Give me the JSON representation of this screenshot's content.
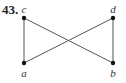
{
  "problem": {
    "number": "43."
  },
  "graph": {
    "nodes": [
      {
        "id": "c",
        "label": "c",
        "x": 24,
        "y": 18,
        "label_x": 24,
        "label_y": 12
      },
      {
        "id": "d",
        "label": "d",
        "x": 113,
        "y": 18,
        "label_x": 113,
        "label_y": 12
      },
      {
        "id": "a",
        "label": "a",
        "x": 24,
        "y": 63,
        "label_x": 24,
        "label_y": 77
      },
      {
        "id": "b",
        "label": "b",
        "x": 113,
        "y": 63,
        "label_x": 113,
        "label_y": 77
      }
    ],
    "edges": [
      {
        "from": "c",
        "to": "a"
      },
      {
        "from": "d",
        "to": "b"
      },
      {
        "from": "c",
        "to": "b"
      },
      {
        "from": "a",
        "to": "d"
      }
    ],
    "colors": {
      "edge": "#555555",
      "node": "#111111",
      "label": "#333333"
    }
  }
}
